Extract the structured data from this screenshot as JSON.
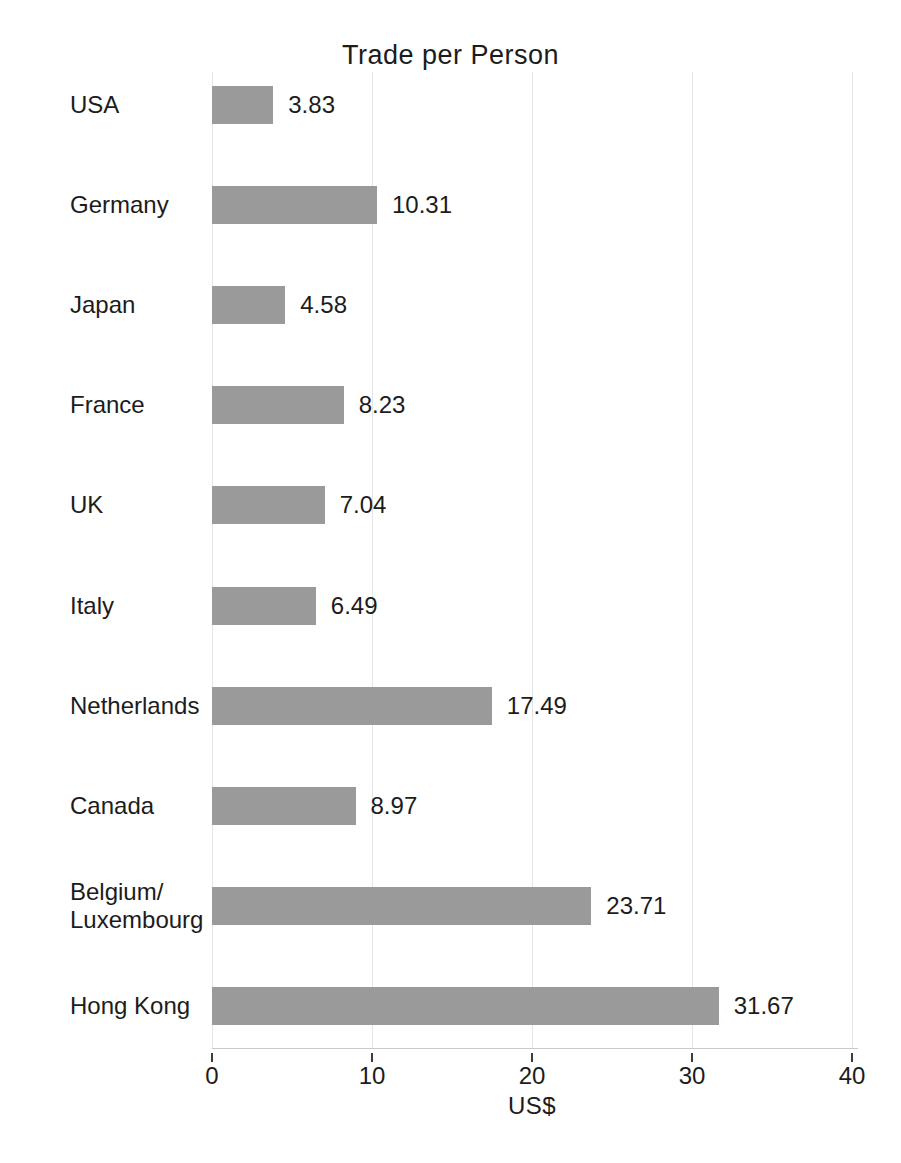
{
  "chart_data": {
    "type": "bar",
    "orientation": "horizontal",
    "title": "Trade per Person",
    "xlabel": "US$",
    "categories": [
      "USA",
      "Germany",
      "Japan",
      "France",
      "UK",
      "Italy",
      "Netherlands",
      "Canada",
      "Belgium/\nLuxembourg",
      "Hong Kong"
    ],
    "values": [
      3.83,
      10.31,
      4.58,
      8.23,
      7.04,
      6.49,
      17.49,
      8.97,
      23.71,
      31.67
    ],
    "value_labels": [
      "3.83",
      "10.31",
      "4.58",
      "8.23",
      "7.04",
      "6.49",
      "17.49",
      "8.97",
      "23.71",
      "31.67"
    ],
    "xlim": [
      0,
      40
    ],
    "xticks": [
      0,
      10,
      20,
      30,
      40
    ],
    "xtick_labels": [
      "0",
      "10",
      "20",
      "30",
      "40"
    ],
    "grid": true,
    "legend": "none",
    "colors": {
      "bar": "#9a9a9a",
      "gridline": "#e4e4e4",
      "axis_line": "#c9c9c9",
      "tick_mark": "#3c3c3c",
      "text": "#1c1c1c",
      "background": "#ffffff"
    }
  }
}
